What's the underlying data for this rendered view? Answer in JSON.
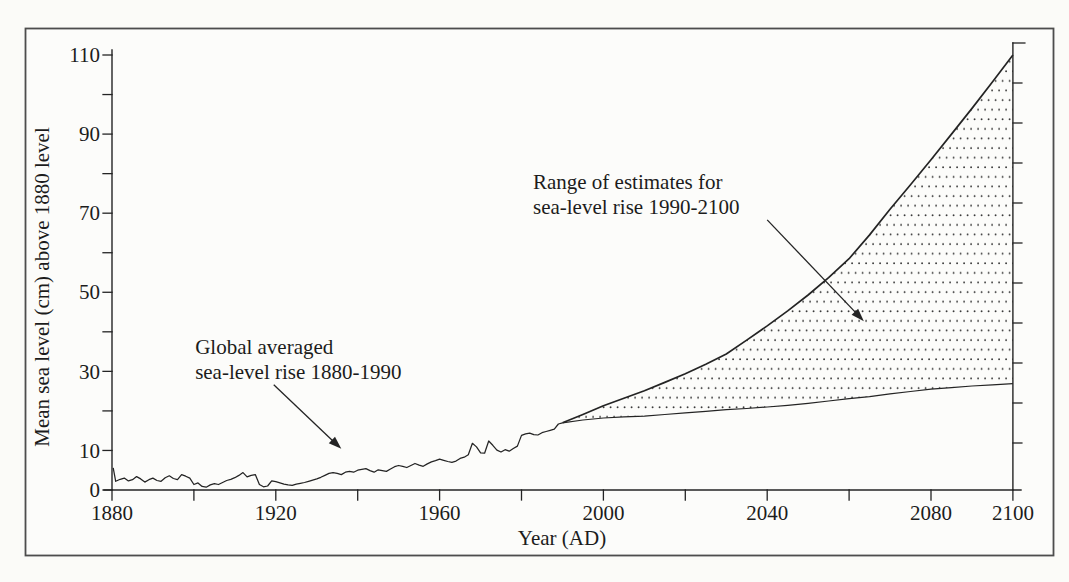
{
  "figure": {
    "background_color": "#fbfbf8",
    "paper_color": "#fcfcfa",
    "ink_color": "#242424",
    "frame_color": "#4d4d4d",
    "stipple_color": "#3a3a3a"
  },
  "chart_data": {
    "type": "line",
    "title": "",
    "xlabel": "Year (AD)",
    "ylabel": "Mean sea level (cm) above 1880 level",
    "xlim": [
      1880,
      2100
    ],
    "ylim": [
      0,
      110
    ],
    "grid": false,
    "legend": "none",
    "x_tick_interval": 20,
    "x_labeled_ticks": [
      "1880",
      "1920",
      "1960",
      "2000",
      "2040",
      "2080",
      "2100"
    ],
    "y_tick_interval": 10,
    "y_labeled_ticks": [
      "0",
      "10",
      "30",
      "50",
      "70",
      "90",
      "110"
    ],
    "right_ruler": true,
    "band_fill_style": "stippled-dots",
    "series": [
      {
        "name": "observed-sea-level",
        "label": "Global averaged sea-level rise 1880-1990",
        "points": [
          [
            1880.3,
            5.6
          ],
          [
            1880.9,
            2.2
          ],
          [
            1882,
            2.7
          ],
          [
            1883,
            3.0
          ],
          [
            1884,
            2.3
          ],
          [
            1885,
            2.6
          ],
          [
            1886,
            3.4
          ],
          [
            1887,
            2.8
          ],
          [
            1888,
            2.0
          ],
          [
            1889,
            2.6
          ],
          [
            1890,
            3.0
          ],
          [
            1891,
            2.4
          ],
          [
            1892,
            2.2
          ],
          [
            1893,
            3.1
          ],
          [
            1894,
            3.6
          ],
          [
            1895,
            2.9
          ],
          [
            1896,
            2.6
          ],
          [
            1897,
            3.9
          ],
          [
            1898,
            3.5
          ],
          [
            1899,
            3.0
          ],
          [
            1900,
            1.4
          ],
          [
            1901,
            1.8
          ],
          [
            1902,
            0.9
          ],
          [
            1903,
            0.7
          ],
          [
            1904,
            1.3
          ],
          [
            1905,
            1.6
          ],
          [
            1906,
            1.4
          ],
          [
            1907,
            1.9
          ],
          [
            1908,
            2.4
          ],
          [
            1909,
            2.7
          ],
          [
            1910,
            3.1
          ],
          [
            1911,
            3.7
          ],
          [
            1912,
            4.4
          ],
          [
            1913,
            3.3
          ],
          [
            1914,
            3.7
          ],
          [
            1915,
            3.9
          ],
          [
            1916,
            1.4
          ],
          [
            1917,
            0.8
          ],
          [
            1918,
            1.0
          ],
          [
            1919,
            2.3
          ],
          [
            1920,
            2.1
          ],
          [
            1921,
            1.8
          ],
          [
            1922,
            1.5
          ],
          [
            1923,
            1.3
          ],
          [
            1924,
            1.2
          ],
          [
            1925,
            1.5
          ],
          [
            1926,
            1.7
          ],
          [
            1927,
            1.9
          ],
          [
            1928,
            2.2
          ],
          [
            1929,
            2.5
          ],
          [
            1930,
            2.8
          ],
          [
            1931,
            3.2
          ],
          [
            1932,
            3.7
          ],
          [
            1933,
            4.2
          ],
          [
            1934,
            4.4
          ],
          [
            1935,
            4.2
          ],
          [
            1936,
            3.9
          ],
          [
            1937,
            4.5
          ],
          [
            1938,
            4.7
          ],
          [
            1939,
            4.5
          ],
          [
            1940,
            5.0
          ],
          [
            1941,
            5.2
          ],
          [
            1942,
            5.4
          ],
          [
            1943,
            4.9
          ],
          [
            1944,
            4.5
          ],
          [
            1945,
            5.1
          ],
          [
            1946,
            4.9
          ],
          [
            1947,
            4.7
          ],
          [
            1948,
            5.3
          ],
          [
            1949,
            5.9
          ],
          [
            1950,
            6.2
          ],
          [
            1951,
            6.0
          ],
          [
            1952,
            5.7
          ],
          [
            1953,
            6.2
          ],
          [
            1954,
            6.7
          ],
          [
            1955,
            6.3
          ],
          [
            1956,
            6.0
          ],
          [
            1957,
            6.6
          ],
          [
            1958,
            7.1
          ],
          [
            1959,
            7.4
          ],
          [
            1960,
            7.8
          ],
          [
            1961,
            7.5
          ],
          [
            1962,
            7.2
          ],
          [
            1963,
            7.0
          ],
          [
            1964,
            7.3
          ],
          [
            1965,
            8.0
          ],
          [
            1966,
            8.3
          ],
          [
            1967,
            8.9
          ],
          [
            1968,
            11.8
          ],
          [
            1969,
            10.9
          ],
          [
            1970,
            9.4
          ],
          [
            1971,
            9.3
          ],
          [
            1972,
            12.4
          ],
          [
            1973,
            11.3
          ],
          [
            1974,
            10.1
          ],
          [
            1975,
            9.6
          ],
          [
            1976,
            10.2
          ],
          [
            1977,
            9.8
          ],
          [
            1978,
            10.5
          ],
          [
            1979,
            11.1
          ],
          [
            1980,
            13.8
          ],
          [
            1981,
            14.2
          ],
          [
            1982,
            14.4
          ],
          [
            1983,
            14.0
          ],
          [
            1984,
            13.9
          ],
          [
            1985,
            14.5
          ],
          [
            1986,
            14.8
          ],
          [
            1987,
            15.1
          ],
          [
            1988,
            15.4
          ],
          [
            1989,
            16.7
          ],
          [
            1990,
            17.0
          ]
        ]
      },
      {
        "name": "upper-estimate",
        "label": "Range of estimates for sea-level rise 1990-2100 (upper bound)",
        "points": [
          [
            1990,
            17.0
          ],
          [
            1995,
            19.1
          ],
          [
            2000,
            21.3
          ],
          [
            2005,
            23.2
          ],
          [
            2010,
            25.1
          ],
          [
            2015,
            27.2
          ],
          [
            2020,
            29.4
          ],
          [
            2025,
            31.8
          ],
          [
            2030,
            34.4
          ],
          [
            2035,
            37.9
          ],
          [
            2040,
            41.5
          ],
          [
            2045,
            45.3
          ],
          [
            2050,
            49.3
          ],
          [
            2055,
            53.7
          ],
          [
            2060,
            58.5
          ],
          [
            2065,
            64.5
          ],
          [
            2070,
            71.0
          ],
          [
            2075,
            77.2
          ],
          [
            2080,
            83.5
          ],
          [
            2085,
            90.0
          ],
          [
            2090,
            96.5
          ],
          [
            2095,
            103.2
          ],
          [
            2100,
            110.0
          ]
        ]
      },
      {
        "name": "lower-estimate",
        "label": "Range of estimates for sea-level rise 1990-2100 (lower bound)",
        "points": [
          [
            1990,
            17.0
          ],
          [
            1995,
            17.7
          ],
          [
            2000,
            18.2
          ],
          [
            2005,
            18.5
          ],
          [
            2010,
            18.7
          ],
          [
            2015,
            19.1
          ],
          [
            2020,
            19.5
          ],
          [
            2025,
            19.9
          ],
          [
            2030,
            20.3
          ],
          [
            2035,
            20.6
          ],
          [
            2040,
            21.0
          ],
          [
            2045,
            21.4
          ],
          [
            2050,
            21.9
          ],
          [
            2055,
            22.5
          ],
          [
            2060,
            23.1
          ],
          [
            2065,
            23.6
          ],
          [
            2070,
            24.3
          ],
          [
            2075,
            24.9
          ],
          [
            2080,
            25.5
          ],
          [
            2085,
            25.9
          ],
          [
            2090,
            26.3
          ],
          [
            2095,
            26.6
          ],
          [
            2100,
            26.9
          ]
        ]
      }
    ],
    "annotations": [
      {
        "id": "historical",
        "lines": [
          "Global averaged",
          "sea-level rise 1880-1990"
        ],
        "text_anchor_data": [
          1900.3,
          39.2
        ],
        "arrow_from_data": [
          1919.5,
          26.6
        ],
        "arrow_to_data": [
          1936.0,
          10.4
        ]
      },
      {
        "id": "range",
        "lines": [
          "Range of estimates for",
          "sea-level rise 1990-2100"
        ],
        "text_anchor_data": [
          1982.8,
          80.9
        ],
        "arrow_from_data": [
          2040.0,
          68.3
        ],
        "arrow_to_data": [
          2063.6,
          42.7
        ]
      }
    ]
  }
}
